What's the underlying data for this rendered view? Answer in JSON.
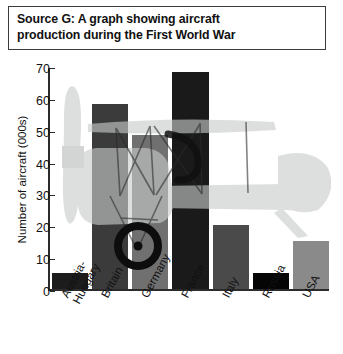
{
  "source": {
    "text": "Source G: A graph showing aircraft\nproduction during the First World War"
  },
  "chart_data": {
    "type": "bar",
    "title": "Source G: A graph showing aircraft production during the First World War",
    "xlabel": "",
    "ylabel": "Number of aircraft (000s)",
    "ylim": [
      0,
      70
    ],
    "yticks": [
      0,
      10,
      20,
      30,
      40,
      50,
      60,
      70
    ],
    "ytick_labels": [
      "0",
      "10",
      "20",
      "30",
      "40",
      "50",
      "60",
      "70"
    ],
    "grid": false,
    "legend": null,
    "categories": [
      "Austria-\nHungary",
      "Britain",
      "Germany",
      "France",
      "Italy",
      "Russia",
      "USA"
    ],
    "category_names": [
      "Austria-Hungary",
      "Britain",
      "Germany",
      "France",
      "Italy",
      "Russia",
      "USA"
    ],
    "values": [
      5,
      58,
      48.5,
      68,
      20,
      5,
      15
    ],
    "bar_colors": [
      "#1c1c1c",
      "#3b3b3b",
      "#707070",
      "#1a1a1a",
      "#4a4a4a",
      "#050505",
      "#8a8a8a"
    ],
    "annotation": "biplane-illustration-watermark"
  },
  "watermark": {
    "name": "biplane-illustration",
    "color": "#c9cbcb",
    "wheel_color": "#1a1a1a"
  }
}
